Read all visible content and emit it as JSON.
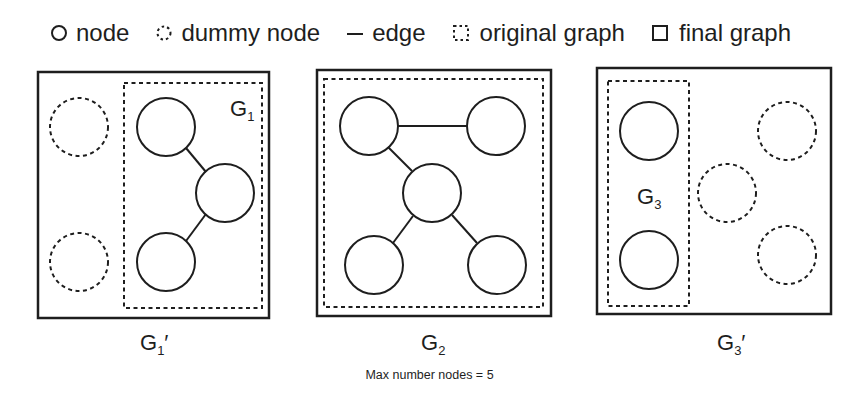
{
  "legend": {
    "items": [
      {
        "icon": "solid-circle-icon",
        "label": "node"
      },
      {
        "icon": "dashed-circle-icon",
        "label": "dummy node"
      },
      {
        "icon": "line-icon",
        "label": "edge"
      },
      {
        "icon": "dashed-square-icon",
        "label": "original graph"
      },
      {
        "icon": "solid-square-icon",
        "label": "final graph"
      }
    ]
  },
  "panels": [
    {
      "original_label": "G",
      "original_sub": "1",
      "final_label": "G",
      "final_sub": "1",
      "final_prime": "′",
      "nodes": 3,
      "dummy_nodes": 2,
      "edges": 2
    },
    {
      "original_label": "G",
      "original_sub": "2",
      "nodes": 5,
      "dummy_nodes": 0,
      "edges": 4
    },
    {
      "original_label": "G",
      "original_sub": "3",
      "final_label": "G",
      "final_sub": "3",
      "final_prime": "′",
      "nodes": 2,
      "dummy_nodes": 3,
      "edges": 0
    }
  ],
  "caption": "Max number nodes = 5",
  "colors": {
    "stroke": "#1e1e1e",
    "background": "#ffffff"
  }
}
